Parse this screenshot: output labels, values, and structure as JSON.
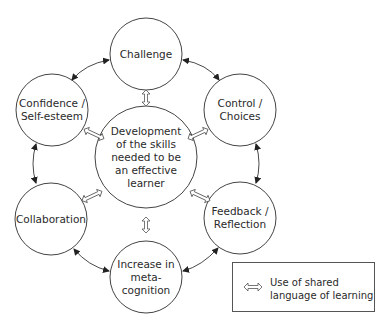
{
  "diagram": {
    "center_node": {
      "label": "Development\nof the skills\nneeded to be\nan effective\nlearner"
    },
    "nodes": [
      {
        "id": "challenge",
        "label": "Challenge"
      },
      {
        "id": "control",
        "label": "Control /\nChoices"
      },
      {
        "id": "feedback",
        "label": "Feedback /\nReflection"
      },
      {
        "id": "increase",
        "label": "Increase in\nmeta-\ncognition"
      },
      {
        "id": "collaboration",
        "label": "Collaboration"
      },
      {
        "id": "confidence",
        "label": "Confidence /\nSelf-esteem"
      }
    ],
    "connections": {
      "outer_ring": "bidirectional solid arrows between adjacent outer nodes",
      "spokes": "hollow double-headed arrows between center and each outer node"
    }
  },
  "legend": {
    "symbol": "hollow-double-arrow",
    "label": "Use of shared\nlanguage of learning"
  }
}
